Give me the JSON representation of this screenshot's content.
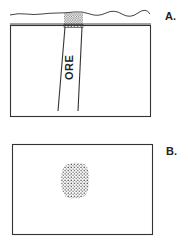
{
  "figure": {
    "panel_a": {
      "label": "A.",
      "ore_label": "ORE",
      "description": "Cross-section: ore vein dipping through rock beneath ground surface, with oxidized/gossan cap at outcrop"
    },
    "panel_b": {
      "label": "B.",
      "description": "Plan view: stippled ore outcrop area within rectangle"
    },
    "colors": {
      "line": "#333333",
      "background": "#ffffff"
    }
  }
}
